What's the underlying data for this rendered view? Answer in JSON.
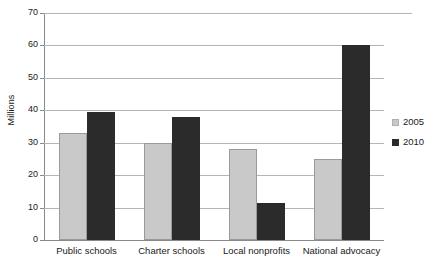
{
  "chart_data": {
    "type": "bar",
    "title": "",
    "xlabel": "",
    "ylabel": "Millions",
    "ylim": [
      0,
      70
    ],
    "ytick_step": 10,
    "yticks": [
      70,
      60,
      50,
      40,
      30,
      20,
      10,
      0
    ],
    "grid": true,
    "legend_position": "right",
    "categories": [
      "Public schools",
      "Charter schools",
      "Local nonprofits",
      "National advocacy"
    ],
    "series": [
      {
        "name": "2005",
        "color": "#c9c9c9",
        "values": [
          33,
          30,
          28,
          25
        ]
      },
      {
        "name": "2010",
        "color": "#2b2b2b",
        "values": [
          39.5,
          38,
          11.5,
          60
        ]
      }
    ]
  },
  "legend": {
    "items": [
      {
        "label": "2005"
      },
      {
        "label": "2010"
      }
    ]
  }
}
